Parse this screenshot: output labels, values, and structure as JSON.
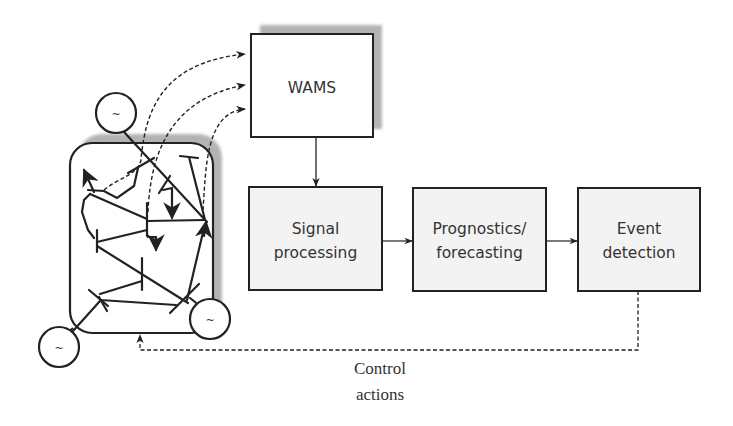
{
  "diagram": {
    "title": "",
    "colors": {
      "stroke": "#222222",
      "box_fill": "#f3f3f3",
      "wams_fill": "#ffffff",
      "shadow": "#b3b3b3",
      "text": "#333333"
    },
    "nodes": {
      "wams": {
        "label": "WAMS"
      },
      "signal_processing": {
        "line1": "Signal",
        "line2": "processing"
      },
      "prognostics": {
        "line1": "Prognostics/",
        "line2": "forecasting"
      },
      "event_detection": {
        "line1": "Event",
        "line2": "detection"
      }
    },
    "power_grid": {
      "label": "power-grid network",
      "generators": [
        {
          "symbol": "~"
        },
        {
          "symbol": "~"
        },
        {
          "symbol": "~"
        }
      ]
    },
    "feedback": {
      "line1": "Control",
      "line2": "actions"
    },
    "edges": [
      {
        "from": "power_grid",
        "to": "wams",
        "style": "dashed",
        "count": 3
      },
      {
        "from": "wams",
        "to": "signal_processing",
        "style": "solid"
      },
      {
        "from": "signal_processing",
        "to": "prognostics",
        "style": "solid"
      },
      {
        "from": "prognostics",
        "to": "event_detection",
        "style": "solid"
      },
      {
        "from": "event_detection",
        "to": "power_grid",
        "style": "dashed",
        "label": "Control actions"
      }
    ]
  }
}
